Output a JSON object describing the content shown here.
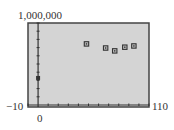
{
  "chart_data": {
    "type": "scatter",
    "title": "",
    "xlabel": "",
    "ylabel": "",
    "xlim": [
      -10,
      110
    ],
    "ylim": [
      0,
      1000000
    ],
    "x_tick_step": 10,
    "y_tick_step": 100000,
    "grid": false,
    "legend": null,
    "labels": {
      "y_max": "1,000,000",
      "x_min": "−10",
      "x_max": "110",
      "x_origin": "0"
    },
    "series": [
      {
        "name": "data",
        "points": [
          {
            "x": 0,
            "y": 330000
          },
          {
            "x": 48,
            "y": 745000
          },
          {
            "x": 67,
            "y": 695000
          },
          {
            "x": 76,
            "y": 660000
          },
          {
            "x": 86,
            "y": 705000
          },
          {
            "x": 95,
            "y": 720000
          }
        ]
      }
    ],
    "colors": {
      "plot_background": "#d4d4d4",
      "frame": "#444444",
      "axis": "#333333",
      "marker": "#333333"
    }
  }
}
